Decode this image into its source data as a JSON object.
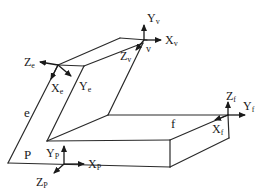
{
  "diagram": {
    "type": "coordinate-frames-isometric",
    "colors": {
      "line": "#2a2a2a",
      "background": "#ffffff"
    },
    "face_labels": {
      "e": "e",
      "f": "f",
      "p": "P",
      "v": "v"
    },
    "frames": {
      "v": {
        "x": "X",
        "x_sub": "v",
        "y": "Y",
        "y_sub": "v",
        "z": "Z",
        "z_sub": "v"
      },
      "e": {
        "x": "X",
        "x_sub": "e",
        "y": "Y",
        "y_sub": "e",
        "z": "Z",
        "z_sub": "e"
      },
      "f": {
        "x": "X",
        "x_sub": "f",
        "y": "Y",
        "y_sub": "f",
        "z": "Z",
        "z_sub": "f"
      },
      "p": {
        "x": "X",
        "x_sub": "P",
        "y": "Y",
        "y_sub": "P",
        "z": "Z",
        "z_sub": "P"
      }
    }
  }
}
